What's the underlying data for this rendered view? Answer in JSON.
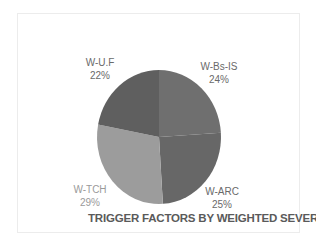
{
  "chart_data": {
    "type": "pie",
    "title": "TRIGGER FACTORS BY WEIGHTED SEVERITY",
    "categories": [
      "W-Bs-IS",
      "W-ARC",
      "W-TCH",
      "W-U.F"
    ],
    "values": [
      24,
      25,
      29,
      22
    ],
    "value_labels": [
      "24%",
      "25%",
      "29%",
      "22%"
    ],
    "start_angle_deg": 0,
    "direction": "clockwise",
    "colors": [
      "#6f6f6f",
      "#676767",
      "#9c9c9c",
      "#5f5f5f"
    ],
    "legend": "none",
    "labels_position": "outside"
  },
  "slices": [
    {
      "name": "W-Bs-IS",
      "pct": "24%"
    },
    {
      "name": "W-ARC",
      "pct": "25%"
    },
    {
      "name": "W-TCH",
      "pct": "29%"
    },
    {
      "name": "W-U.F",
      "pct": "22%"
    }
  ],
  "title": "TRIGGER FACTORS BY WEIGHTED SEVERITY"
}
